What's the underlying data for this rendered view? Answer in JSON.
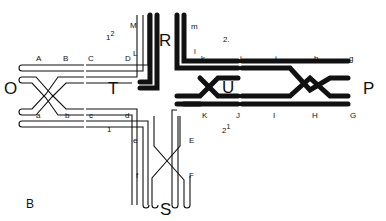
{
  "figure": {
    "panel_label": "B",
    "arms": {
      "O": {
        "label": "O",
        "style": "outline",
        "upper_loci": [
          "A",
          "B",
          "C",
          "D"
        ],
        "lower_loci": [
          "a",
          "b",
          "c",
          "d"
        ]
      },
      "R": {
        "label": "R",
        "style": "filled",
        "left_loci": [
          "M",
          "L"
        ],
        "right_loci": [
          "m",
          "l"
        ]
      },
      "P": {
        "label": "P",
        "style": "filled",
        "upper_loci": [
          "k",
          "j",
          "i",
          "h",
          "g"
        ],
        "lower_loci": [
          "K",
          "J",
          "I",
          "H",
          "G"
        ]
      },
      "S": {
        "label": "S",
        "style": "outline",
        "left_loci": [
          "e",
          "f"
        ],
        "right_loci": [
          "E",
          "F"
        ]
      }
    },
    "centers": {
      "T": "T",
      "U": "U"
    },
    "annotations": {
      "n12_base": "1",
      "n12_sup": "2",
      "n2": "2.",
      "n1": "1",
      "n21_base": "2",
      "n21_sup": "1"
    }
  },
  "labels": {
    "A": "A",
    "B": "B",
    "C": "C",
    "D": "D",
    "L": "L",
    "M": "M",
    "a": "a",
    "b": "b",
    "c": "c",
    "d": "d",
    "e": "e",
    "f": "f",
    "E": "E",
    "F": "F",
    "m": "m",
    "l": "l",
    "k": "k",
    "j": "j",
    "i": "i",
    "h": "h",
    "g": "g",
    "K": "K",
    "J": "J",
    "I": "I",
    "H": "H",
    "G": "G",
    "O": "O",
    "T": "T",
    "R": "R",
    "U": "U",
    "P": "P",
    "S": "S",
    "panel": "B"
  }
}
